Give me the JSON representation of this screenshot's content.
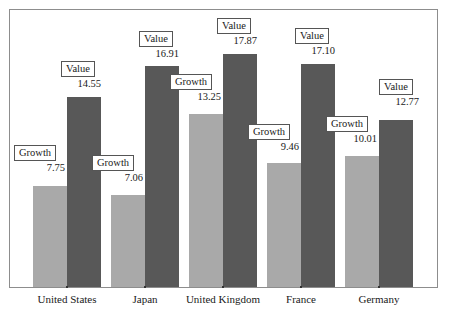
{
  "chart_data": {
    "type": "bar",
    "title": "",
    "subtitle": "",
    "xlabel": "",
    "ylabel": "",
    "grid": false,
    "legend_position": "none",
    "ylim": [
      0,
      21.2
    ],
    "categories": [
      "United States",
      "Japan",
      "United Kingdom",
      "France",
      "Germany"
    ],
    "series": [
      {
        "name": "Growth",
        "color": "#a9a9a9",
        "values": [
          7.75,
          7.06,
          13.25,
          9.46,
          10.01
        ]
      },
      {
        "name": "Value",
        "color": "#585858",
        "values": [
          14.55,
          16.91,
          17.87,
          17.1,
          12.77
        ]
      }
    ],
    "annotations": [
      {
        "text": "Growth",
        "value": "7.75",
        "series": "Growth",
        "category": "United States"
      },
      {
        "text": "Value",
        "value": "14.55",
        "series": "Value",
        "category": "United States"
      },
      {
        "text": "Growth",
        "value": "7.06",
        "series": "Growth",
        "category": "Japan"
      },
      {
        "text": "Value",
        "value": "16.91",
        "series": "Value",
        "category": "Japan"
      },
      {
        "text": "Growth",
        "value": "13.25",
        "series": "Growth",
        "category": "United Kingdom"
      },
      {
        "text": "Value",
        "value": "17.87",
        "series": "Value",
        "category": "United Kingdom"
      },
      {
        "text": "Growth",
        "value": "9.46",
        "series": "Growth",
        "category": "France"
      },
      {
        "text": "Value",
        "value": "17.10",
        "series": "Value",
        "category": "France"
      },
      {
        "text": "Growth",
        "value": "10.01",
        "series": "Growth",
        "category": "Germany"
      },
      {
        "text": "Value",
        "value": "12.77",
        "series": "Value",
        "category": "Germany"
      }
    ]
  },
  "labels": {
    "growth_caption": "Growth",
    "value_caption": "Value",
    "us_growth_num": "7.75",
    "us_value_num": "14.55",
    "jp_growth_num": "7.06",
    "jp_value_num": "16.91",
    "uk_growth_num": "13.25",
    "uk_value_num": "17.87",
    "fr_growth_num": "9.46",
    "fr_value_num": "17.10",
    "de_growth_num": "10.01",
    "de_value_num": "12.77",
    "cat_us": "United States",
    "cat_jp": "Japan",
    "cat_uk": "United Kingdom",
    "cat_fr": "France",
    "cat_de": "Germany"
  },
  "colors": {
    "growth_bar": "#a9a9a9",
    "value_bar": "#585858",
    "frame": "#8d8d8d",
    "text": "#1a1a1a"
  }
}
